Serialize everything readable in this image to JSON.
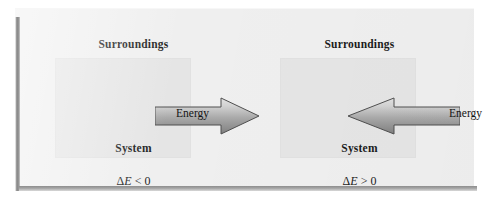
{
  "figure": {
    "type": "thermodynamics-energy-flow-diagram",
    "background_color": "#efefef",
    "system_box_color": "#e5e5e5",
    "arrow_light_color": "#dcdcdc",
    "arrow_dark_color": "#8a8a8a",
    "arrow_outline_color": "#4a4a4a",
    "text_color": "#1b1b1b"
  },
  "panels": [
    {
      "id": "exothermic",
      "surroundings_label": "Surroundings",
      "system_label": "System",
      "energy_label": "Energy",
      "delta_prefix": "Δ",
      "delta_symbol": "E",
      "delta_relation": " < 0",
      "delta_expression": "ΔE < 0",
      "arrow_direction": "right",
      "arrow_name": "energy-leaving-system-arrow"
    },
    {
      "id": "endothermic",
      "surroundings_label": "Surroundings",
      "system_label": "System",
      "energy_label": "Energy",
      "delta_prefix": "Δ",
      "delta_symbol": "E",
      "delta_relation": " > 0",
      "delta_expression": "ΔE > 0",
      "arrow_direction": "left",
      "arrow_name": "energy-entering-system-arrow"
    }
  ]
}
